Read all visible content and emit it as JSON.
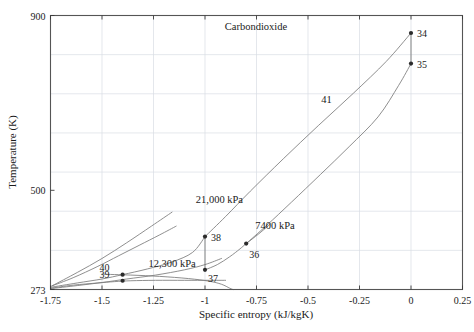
{
  "chart_data": {
    "type": "line",
    "title": "Carbondioxide",
    "xlabel": "Specific entropy (kJ/kgK)",
    "ylabel": "Temperature (K)",
    "xlim": [
      -1.75,
      0.25
    ],
    "ylim": [
      273,
      900
    ],
    "grid": true,
    "legend": "none",
    "xticks": [
      -1.75,
      -1.5,
      -1.25,
      -1,
      -0.75,
      -0.5,
      -0.25,
      0,
      0.25
    ],
    "xtick_labels": [
      "-1.75",
      "-1.5",
      "-1.25",
      "-1",
      "-0.75",
      "-0.5",
      "-0.25",
      "0",
      "0.25"
    ],
    "yticks": [
      273,
      500,
      900
    ],
    "ytick_labels": [
      "273",
      "500",
      "900"
    ],
    "annotations": [
      {
        "name": "pressure-21000",
        "text": "21,000 kPa",
        "s": -0.93,
        "T": 470
      },
      {
        "name": "pressure-7400",
        "text": "7400 kPa",
        "s": -0.66,
        "T": 412
      },
      {
        "name": "pressure-12300",
        "text": "12,300 kPa",
        "s": -1.16,
        "T": 324
      },
      {
        "name": "process-41",
        "text": "41",
        "s": -0.41,
        "T": 700
      }
    ],
    "state_points": [
      {
        "id": "34",
        "s": 0.0,
        "T": 860,
        "label_dx": 6,
        "label_dy": 4
      },
      {
        "id": "35",
        "s": 0.0,
        "T": 790,
        "label_dx": 6,
        "label_dy": 4
      },
      {
        "id": "36",
        "s": -0.8,
        "T": 378,
        "label_dx": 3,
        "label_dy": 14
      },
      {
        "id": "37",
        "s": -1.0,
        "T": 318,
        "label_dx": 3,
        "label_dy": 12
      },
      {
        "id": "38",
        "s": -1.0,
        "T": 394,
        "label_dx": 6,
        "label_dy": 4
      },
      {
        "id": "39",
        "s": -1.4,
        "T": 293,
        "label_dx": -13,
        "label_dy": -3
      },
      {
        "id": "40",
        "s": -1.4,
        "T": 307,
        "label_dx": -13,
        "label_dy": -4
      }
    ],
    "series": [
      {
        "name": "isobar-21000-upper",
        "comment": "21,000 kPa line from state 38 rising to state 34",
        "points": [
          [
            -1.0,
            394
          ],
          [
            -0.9,
            440
          ],
          [
            -0.78,
            498
          ],
          [
            -0.62,
            572
          ],
          [
            -0.45,
            648
          ],
          [
            -0.28,
            722
          ],
          [
            -0.12,
            795
          ],
          [
            0.0,
            860
          ]
        ]
      },
      {
        "name": "isobar-7400-upper",
        "comment": "7400 kPa line from state 36 rising to state 35",
        "points": [
          [
            -0.8,
            378
          ],
          [
            -0.7,
            420
          ],
          [
            -0.58,
            473
          ],
          [
            -0.44,
            536
          ],
          [
            -0.3,
            600
          ],
          [
            -0.16,
            668
          ],
          [
            -0.06,
            740
          ],
          [
            0.0,
            790
          ]
        ]
      },
      {
        "name": "expansion-34-35",
        "comment": "vertical isentropic line connecting 34 and 35",
        "points": [
          [
            0.0,
            860
          ],
          [
            0.0,
            790
          ]
        ]
      },
      {
        "name": "saturation-dome-liquid",
        "comment": "left/liquid branch of dome rising from lower-left to critical region",
        "points": [
          [
            -1.75,
            275
          ],
          [
            -1.62,
            282
          ],
          [
            -1.5,
            289
          ],
          [
            -1.38,
            297
          ],
          [
            -1.24,
            306
          ],
          [
            -1.1,
            318
          ],
          [
            -1.0,
            330
          ],
          [
            -0.92,
            344
          ]
        ]
      },
      {
        "name": "saturation-dome-vapour",
        "comment": "vapour branch descending to the axis",
        "points": [
          [
            -1.5,
            308
          ],
          [
            -1.36,
            306
          ],
          [
            -1.22,
            303
          ],
          [
            -1.08,
            298
          ],
          [
            -0.98,
            292
          ],
          [
            -0.92,
            285
          ],
          [
            -0.88,
            276
          ],
          [
            -0.865,
            273
          ]
        ]
      },
      {
        "name": "isobar-12300-liquid",
        "comment": "12,300 kPa liquid line from lower-left through 40 toward 38",
        "points": [
          [
            -1.75,
            278
          ],
          [
            -1.62,
            288
          ],
          [
            -1.5,
            297
          ],
          [
            -1.4,
            307
          ],
          [
            -1.28,
            320
          ],
          [
            -1.16,
            336
          ],
          [
            -1.06,
            358
          ],
          [
            -1.0,
            394
          ]
        ]
      },
      {
        "name": "isobar-low-liquid",
        "comment": "lower liquid isobar from left edge through 39 flattening right",
        "points": [
          [
            -1.75,
            276
          ],
          [
            -1.64,
            283
          ],
          [
            -1.52,
            288
          ],
          [
            -1.44,
            291
          ],
          [
            -1.36,
            293
          ],
          [
            -1.24,
            294
          ],
          [
            -1.1,
            294
          ],
          [
            -0.98,
            294
          ],
          [
            -0.9,
            294
          ]
        ]
      },
      {
        "name": "isobar-21000-lower-branch",
        "comment": "steep 21,000 kPa branch rising from left edge",
        "points": [
          [
            -1.75,
            280
          ],
          [
            -1.64,
            300
          ],
          [
            -1.52,
            326
          ],
          [
            -1.42,
            350
          ],
          [
            -1.32,
            374
          ],
          [
            -1.22,
            398
          ],
          [
            -1.14,
            418
          ]
        ]
      },
      {
        "name": "isobar-aux-branch",
        "comment": "auxiliary steep branch rising from left edge to upper region",
        "points": [
          [
            -1.74,
            282
          ],
          [
            -1.62,
            312
          ],
          [
            -1.5,
            344
          ],
          [
            -1.38,
            380
          ],
          [
            -1.26,
            418
          ],
          [
            -1.16,
            450
          ]
        ]
      },
      {
        "name": "compression-37-38",
        "comment": "vertical line connecting state 37 to state 38",
        "points": [
          [
            -1.0,
            318
          ],
          [
            -1.0,
            394
          ]
        ]
      },
      {
        "name": "dome-right-37-36",
        "comment": "curve from 37 through 36 continuing upward right",
        "points": [
          [
            -1.0,
            318
          ],
          [
            -0.94,
            330
          ],
          [
            -0.88,
            348
          ],
          [
            -0.83,
            366
          ],
          [
            -0.8,
            378
          ],
          [
            -0.74,
            400
          ],
          [
            -0.68,
            424
          ]
        ]
      }
    ]
  }
}
